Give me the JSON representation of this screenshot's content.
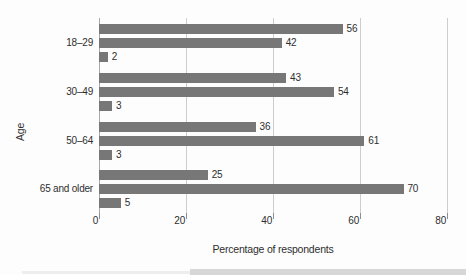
{
  "chart_data": {
    "type": "bar",
    "orientation": "horizontal",
    "title": "",
    "xlabel": "Percentage of respondents",
    "ylabel": "Age",
    "xlim": [
      0,
      80
    ],
    "xticks": [
      0,
      20,
      40,
      60,
      80
    ],
    "grid": true,
    "legend": "none",
    "value_labels": true,
    "bar_color": "#777777",
    "gridline_color": "#cdcdcd",
    "categories": [
      "18–29",
      "30–49",
      "50–64",
      "65 and older"
    ],
    "groups": [
      {
        "category": "18–29",
        "values": [
          56,
          42,
          2
        ]
      },
      {
        "category": "30–49",
        "values": [
          43,
          54,
          3
        ]
      },
      {
        "category": "50–64",
        "values": [
          36,
          61,
          3
        ]
      },
      {
        "category": "65 and older",
        "values": [
          25,
          70,
          5
        ]
      }
    ]
  }
}
